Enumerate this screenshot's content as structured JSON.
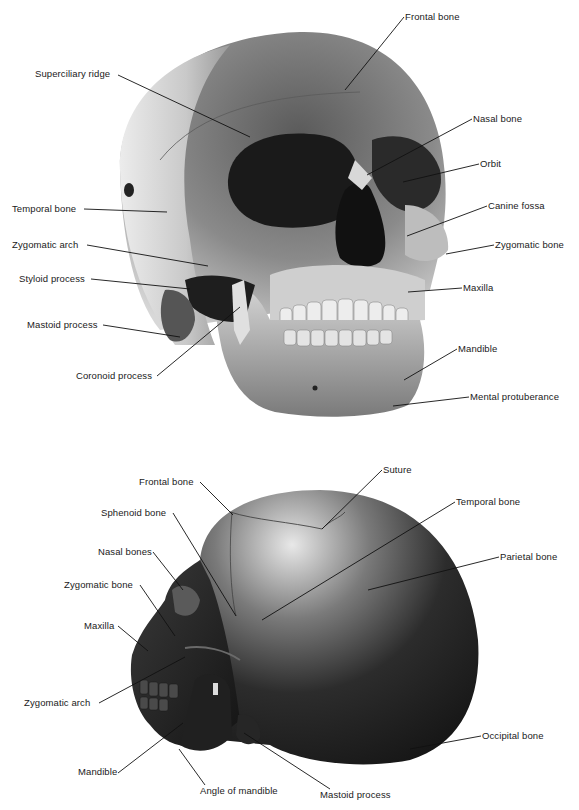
{
  "figure": {
    "panels": [
      {
        "id": "front-view",
        "view": "anterolateral view of skull",
        "labels": [
          {
            "text": "Frontal bone",
            "x": 405,
            "y": 11,
            "tx": 345,
            "ty": 90
          },
          {
            "text": "Superciliary ridge",
            "x": 35,
            "y": 68,
            "tx": 250,
            "ty": 137
          },
          {
            "text": "Nasal bone",
            "x": 473,
            "y": 113,
            "tx": 367,
            "ty": 175
          },
          {
            "text": "Orbit",
            "x": 480,
            "y": 158,
            "tx": 403,
            "ty": 182
          },
          {
            "text": "Temporal bone",
            "x": 12,
            "y": 203,
            "tx": 167,
            "ty": 212
          },
          {
            "text": "Canine fossa",
            "x": 488,
            "y": 200,
            "tx": 407,
            "ty": 236
          },
          {
            "text": "Zygomatic arch",
            "x": 12,
            "y": 239,
            "tx": 208,
            "ty": 266
          },
          {
            "text": "Zygomatic bone",
            "x": 495,
            "y": 239,
            "tx": 446,
            "ty": 254
          },
          {
            "text": "Styloid process",
            "x": 19,
            "y": 273,
            "tx": 190,
            "ty": 289
          },
          {
            "text": "Maxilla",
            "x": 463,
            "y": 282,
            "tx": 408,
            "ty": 292
          },
          {
            "text": "Mastoid process",
            "x": 27,
            "y": 319,
            "tx": 180,
            "ty": 337
          },
          {
            "text": "Mandible",
            "x": 458,
            "y": 343,
            "tx": 404,
            "ty": 380
          },
          {
            "text": "Coronoid process",
            "x": 76,
            "y": 370,
            "tx": 240,
            "ty": 307
          },
          {
            "text": "Mental protuberance",
            "x": 470,
            "y": 391,
            "tx": 393,
            "ty": 406
          }
        ]
      },
      {
        "id": "lateral-view",
        "view": "left lateral view of skull",
        "labels": [
          {
            "text": "Frontal bone",
            "x": 139,
            "y": 476,
            "tx": 233,
            "ty": 515
          },
          {
            "text": "Suture",
            "x": 383,
            "y": 464,
            "tx": 322,
            "ty": 529
          },
          {
            "text": "Temporal bone",
            "x": 456,
            "y": 496,
            "tx": 262,
            "ty": 620
          },
          {
            "text": "Sphenoid bone",
            "x": 101,
            "y": 507,
            "tx": 236,
            "ty": 616
          },
          {
            "text": "Parietal bone",
            "x": 500,
            "y": 551,
            "tx": 368,
            "ty": 590
          },
          {
            "text": "Nasal bones",
            "x": 98,
            "y": 546,
            "tx": 183,
            "ty": 590
          },
          {
            "text": "Zygomatic bone",
            "x": 64,
            "y": 579,
            "tx": 175,
            "ty": 636
          },
          {
            "text": "Maxilla",
            "x": 84,
            "y": 620,
            "tx": 148,
            "ty": 651
          },
          {
            "text": "Zygomatic arch",
            "x": 24,
            "y": 697,
            "tx": 185,
            "ty": 657
          },
          {
            "text": "Occipital bone",
            "x": 482,
            "y": 730,
            "tx": 410,
            "ty": 749
          },
          {
            "text": "Mandible",
            "x": 78,
            "y": 766,
            "tx": 183,
            "ty": 723
          },
          {
            "text": "Angle of mandible",
            "x": 200,
            "y": 785,
            "tx": 179,
            "ty": 749
          },
          {
            "text": "Mastoid process",
            "x": 320,
            "y": 789,
            "tx": 244,
            "ty": 733
          }
        ]
      }
    ]
  }
}
